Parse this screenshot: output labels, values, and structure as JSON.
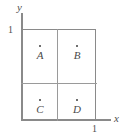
{
  "figure": {
    "width": 127,
    "height": 136,
    "background_color": "#ffffff",
    "line_color": "#8a8a8a",
    "divider_color": "#9a9a9a",
    "text_color": "#4a4a4a",
    "marker_color": "#3f3f3f"
  },
  "axes": {
    "x": {
      "name": "x",
      "ticks": [
        {
          "label": "1",
          "value": 1
        }
      ]
    },
    "y": {
      "name": "y",
      "ticks": [
        {
          "label": "1",
          "value": 1
        }
      ]
    }
  },
  "chart_data": {
    "type": "scatter",
    "title": "",
    "xlabel": "x",
    "ylabel": "y",
    "xlim": [
      0,
      1
    ],
    "ylim": [
      0,
      1
    ],
    "xticks": [
      "1"
    ],
    "yticks": [
      "1"
    ],
    "grid": true,
    "gridlines": {
      "vertical": [
        0.5
      ],
      "horizontal": [
        0.5
      ]
    },
    "legend": null,
    "points": [
      {
        "label": "A",
        "x": 0.25,
        "y": 0.75
      },
      {
        "label": "B",
        "x": 0.75,
        "y": 0.75
      },
      {
        "label": "C",
        "x": 0.25,
        "y": 0.25
      },
      {
        "label": "D",
        "x": 0.75,
        "y": 0.25
      }
    ]
  },
  "quadrants": [
    {
      "id": "a",
      "label": "A",
      "marker": "point-dot"
    },
    {
      "id": "b",
      "label": "B",
      "marker": "point-dot"
    },
    {
      "id": "c",
      "label": "C",
      "marker": "point-dot"
    },
    {
      "id": "d",
      "label": "D",
      "marker": "point-dot"
    }
  ]
}
